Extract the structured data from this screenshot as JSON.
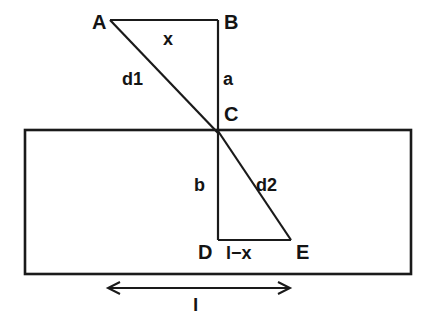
{
  "figure": {
    "kind": "geometry-diagram",
    "background_color": "#ffffff",
    "line_color": "#1a1a1a",
    "text_color": "#141414"
  },
  "vertices": [
    {
      "id": "A",
      "label": "A",
      "x": 110,
      "y": 20
    },
    {
      "id": "B",
      "label": "B",
      "x": 218,
      "y": 20
    },
    {
      "id": "C",
      "label": "C",
      "x": 218,
      "y": 131
    },
    {
      "id": "D",
      "label": "D",
      "x": 218,
      "y": 240
    },
    {
      "id": "E",
      "label": "E",
      "x": 291,
      "y": 240
    }
  ],
  "vertex_labels": [
    {
      "name": "vertex-label-a",
      "text": "A",
      "left": 92,
      "top": 12
    },
    {
      "name": "vertex-label-b",
      "text": "B",
      "left": 224,
      "top": 12
    },
    {
      "name": "vertex-label-c",
      "text": "C",
      "left": 224,
      "top": 104
    },
    {
      "name": "vertex-label-d",
      "text": "D",
      "left": 198,
      "top": 242
    },
    {
      "name": "vertex-label-e",
      "text": "E",
      "left": 296,
      "top": 242
    }
  ],
  "segment_labels": [
    {
      "name": "segment-label-x",
      "text": "x",
      "left": 163,
      "top": 30
    },
    {
      "name": "segment-label-a",
      "text": "a",
      "left": 223,
      "top": 70
    },
    {
      "name": "segment-label-d1",
      "text": "d1",
      "left": 122,
      "top": 70
    },
    {
      "name": "segment-label-b",
      "text": "b",
      "left": 194,
      "top": 176
    },
    {
      "name": "segment-label-d2",
      "text": "d2",
      "left": 256,
      "top": 176
    },
    {
      "name": "segment-label-l-minus-x",
      "text": "l−x",
      "left": 226,
      "top": 244
    }
  ],
  "dimension": {
    "name": "dimension-l",
    "label": "l",
    "label_left": 193,
    "label_top": 295,
    "start_x": 108,
    "end_x": 290,
    "y": 288
  },
  "slab": {
    "name": "slab-rectangle",
    "left": 25,
    "top": 130,
    "right": 411,
    "bottom": 274
  },
  "segments": [
    {
      "name": "segment-ab",
      "from": "A",
      "to": "B",
      "measure_label": "x"
    },
    {
      "name": "segment-bc",
      "from": "B",
      "to": "C",
      "measure_label": "a"
    },
    {
      "name": "segment-ac-d1",
      "from": "A",
      "to": "C",
      "measure_label": "d1"
    },
    {
      "name": "segment-cd",
      "from": "C",
      "to": "D",
      "measure_label": "b"
    },
    {
      "name": "segment-de",
      "from": "D",
      "to": "E",
      "measure_label": "l−x"
    },
    {
      "name": "segment-ce-d2",
      "from": "C",
      "to": "E",
      "measure_label": "d2"
    }
  ]
}
